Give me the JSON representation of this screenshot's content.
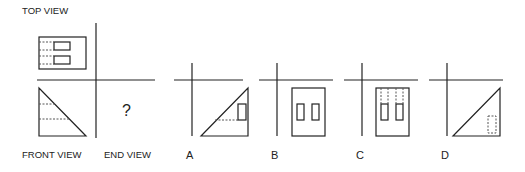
{
  "labels": {
    "top_view": "TOP VIEW",
    "front_view": "FRONT VIEW",
    "end_view": "END VIEW",
    "question_mark": "?"
  },
  "options": [
    {
      "letter": "A"
    },
    {
      "letter": "B"
    },
    {
      "letter": "C"
    },
    {
      "letter": "D"
    }
  ],
  "colors": {
    "line": "#222222",
    "dotted": "#555555",
    "background": "#ffffff"
  }
}
